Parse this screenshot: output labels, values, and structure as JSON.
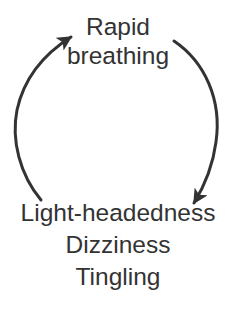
{
  "diagram": {
    "type": "cycle",
    "nodes": [
      {
        "id": "top",
        "lines": [
          "Rapid",
          "breathing"
        ]
      },
      {
        "id": "bottom",
        "lines": [
          "Light-headedness",
          "Dizziness",
          "Tingling"
        ]
      }
    ],
    "edges": [
      {
        "from": "top",
        "to": "bottom",
        "side": "right"
      },
      {
        "from": "bottom",
        "to": "top",
        "side": "left"
      }
    ],
    "colors": {
      "stroke": "#333333",
      "text": "#333333",
      "background": "#ffffff"
    }
  }
}
